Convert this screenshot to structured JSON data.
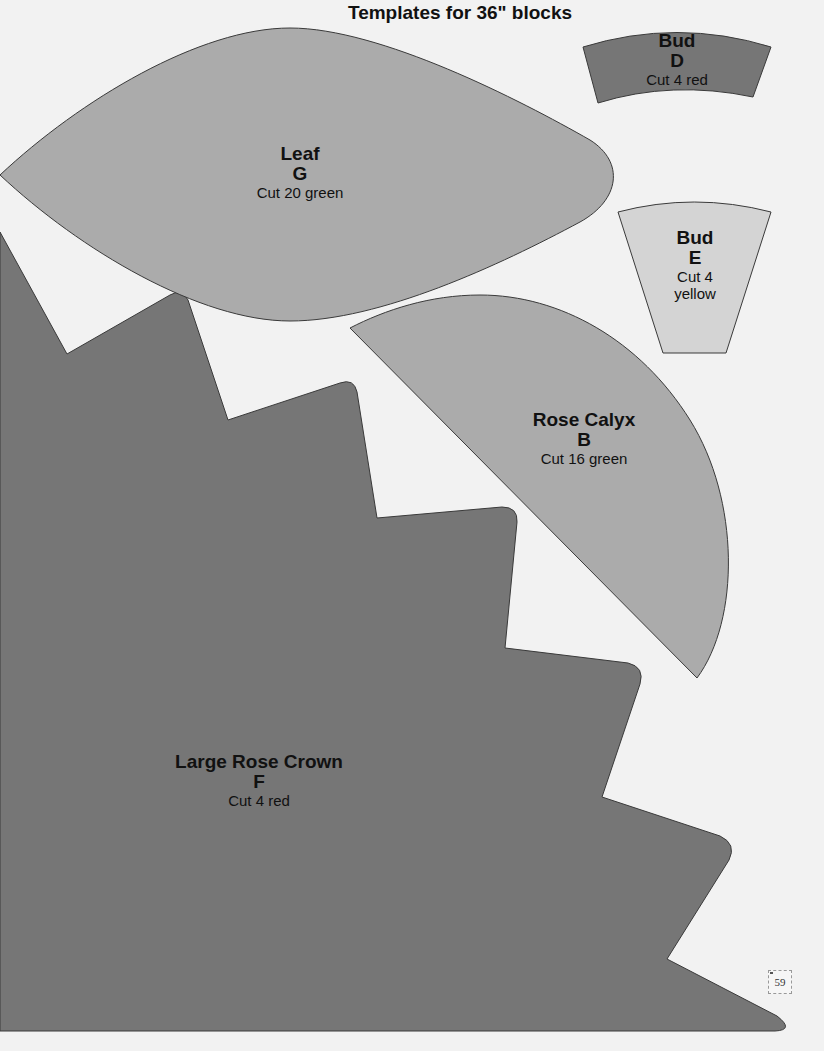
{
  "page": {
    "title": "Templates for 36\" blocks",
    "page_number": "59",
    "colors": {
      "background": "#f2f2f2",
      "red_piece": "#767676",
      "green_piece": "#ababab",
      "yellow_piece": "#d4d4d4",
      "outline": "#3a3a3a"
    }
  },
  "templates": [
    {
      "id": "bud-d",
      "name": "Bud",
      "letter": "D",
      "cut": "Cut 4 red",
      "fabric": "red"
    },
    {
      "id": "leaf-g",
      "name": "Leaf",
      "letter": "G",
      "cut": "Cut 20 green",
      "fabric": "green"
    },
    {
      "id": "bud-e",
      "name": "Bud",
      "letter": "E",
      "cut": "Cut 4",
      "cut_line2": "yellow",
      "fabric": "yellow"
    },
    {
      "id": "rose-calyx-b",
      "name": "Rose Calyx",
      "letter": "B",
      "cut": "Cut 16 green",
      "fabric": "green"
    },
    {
      "id": "large-rose-crown-f",
      "name": "Large Rose Crown",
      "letter": "F",
      "cut": "Cut 4 red",
      "fabric": "red"
    }
  ]
}
